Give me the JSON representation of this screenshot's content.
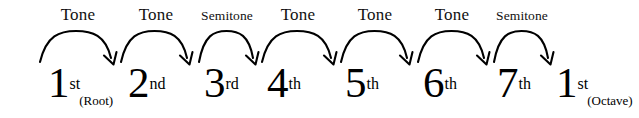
{
  "figure": {
    "background_color": "#ffffff",
    "ink_color": "#000000"
  },
  "chart_data": {
    "type": "diagram",
    "xlabel": "",
    "ylabel": "",
    "degrees": [
      {
        "number": "1",
        "ordinal": "st",
        "note": "(Root)",
        "x": 48
      },
      {
        "number": "2",
        "ordinal": "nd",
        "note": "",
        "x": 128
      },
      {
        "number": "3",
        "ordinal": "rd",
        "note": "",
        "x": 204
      },
      {
        "number": "4",
        "ordinal": "th",
        "note": "",
        "x": 267
      },
      {
        "number": "5",
        "ordinal": "th",
        "note": "",
        "x": 345
      },
      {
        "number": "6",
        "ordinal": "th",
        "note": "",
        "x": 423
      },
      {
        "number": "7",
        "ordinal": "th",
        "note": "",
        "x": 497
      },
      {
        "number": "1",
        "ordinal": "st",
        "note": "(Octave)",
        "x": 556
      }
    ],
    "intervals": [
      {
        "label": "Tone",
        "from": "1st",
        "to": "2nd",
        "size": "tone",
        "x_start": 40,
        "x_end": 112,
        "label_x": 78
      },
      {
        "label": "Tone",
        "from": "2nd",
        "to": "3rd",
        "size": "tone",
        "x_start": 121,
        "x_end": 188,
        "label_x": 156
      },
      {
        "label": "Semitone",
        "from": "3rd",
        "to": "4th",
        "size": "semitone",
        "x_start": 199,
        "x_end": 254,
        "label_x": 227
      },
      {
        "label": "Tone",
        "from": "4th",
        "to": "5th",
        "size": "tone",
        "x_start": 262,
        "x_end": 332,
        "label_x": 298
      },
      {
        "label": "Tone",
        "from": "5th",
        "to": "6th",
        "size": "tone",
        "x_start": 341,
        "x_end": 408,
        "label_x": 375
      },
      {
        "label": "Tone",
        "from": "6th",
        "to": "7th",
        "size": "tone",
        "x_start": 418,
        "x_end": 485,
        "label_x": 452
      },
      {
        "label": "Semitone",
        "from": "7th",
        "to": "1st",
        "size": "semitone",
        "x_start": 494,
        "x_end": 549,
        "label_x": 522
      }
    ],
    "interval_sequence": [
      "Tone",
      "Tone",
      "Semitone",
      "Tone",
      "Tone",
      "Tone",
      "Semitone"
    ],
    "degree_sequence": [
      "1st",
      "2nd",
      "3rd",
      "4th",
      "5th",
      "6th",
      "7th",
      "1st"
    ],
    "arrow_geometry": {
      "baseline_y": 62,
      "apex_y": 31,
      "label_baseline_y": 22,
      "degree_baseline_y": 104,
      "stroke_color": "#000000"
    }
  }
}
